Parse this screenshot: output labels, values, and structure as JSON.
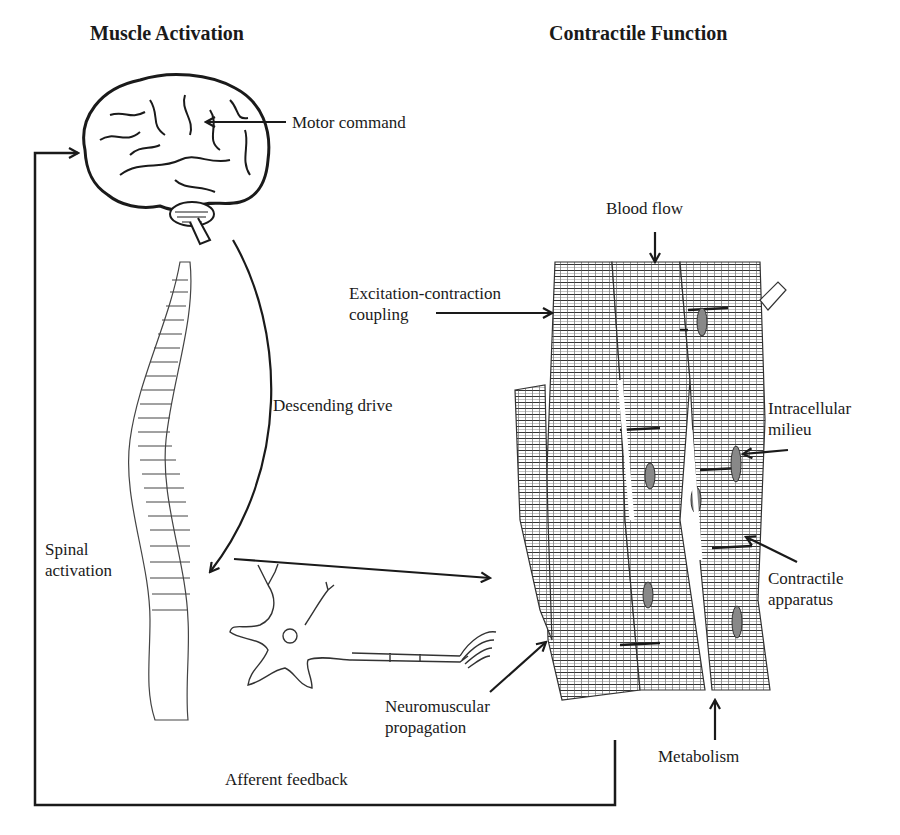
{
  "headings": {
    "left": "Muscle Activation",
    "right": "Contractile Function"
  },
  "labels": {
    "motor_command": "Motor command",
    "descending_drive": "Descending drive",
    "spinal_activation": [
      "Spinal",
      "activation"
    ],
    "neuromuscular_propagation": [
      "Neuromuscular",
      "propagation"
    ],
    "afferent_feedback": "Afferent feedback",
    "blood_flow": "Blood flow",
    "excitation_contraction_coupling": [
      "Excitation-contraction",
      "coupling"
    ],
    "intracellular_milieu": [
      "Intracellular",
      "milieu"
    ],
    "contractile_apparatus": [
      "Contractile",
      "apparatus"
    ],
    "metabolism": "Metabolism"
  },
  "colors": {
    "line": "#1a1a1a",
    "fill": "#ffffff",
    "nucleus": "#888888"
  }
}
